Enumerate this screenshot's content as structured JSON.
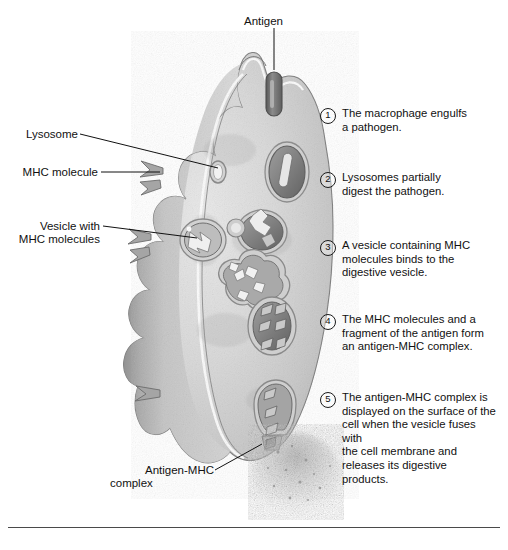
{
  "figure": {
    "type": "biology-diagram",
    "antigen_label": "Antigen",
    "bottom_caption": ""
  },
  "labels": [
    {
      "id": "lysosome",
      "text": "Lysosome"
    },
    {
      "id": "mhc-molecule",
      "text": "MHC molecule"
    },
    {
      "id": "vesicle-mhc",
      "line1": "Vesicle with",
      "line2": "MHC molecules"
    },
    {
      "id": "antigen-mhc",
      "line1": "Antigen-MHC",
      "line2": "complex"
    }
  ],
  "steps": [
    {
      "num": "1",
      "text": "The macrophage engulfs\na pathogen."
    },
    {
      "num": "2",
      "text": "Lysosomes partially\ndigest the pathogen."
    },
    {
      "num": "3",
      "text": "A vesicle containing MHC\nmolecules binds to the\ndigestive vesicle."
    },
    {
      "num": "4",
      "text": "The MHC molecules and a\nfragment of the antigen form\nan antigen-MHC complex."
    },
    {
      "num": "5",
      "text": "The antigen-MHC complex is\ndisplayed on the surface of the\ncell when the vesicle fuses with\nthe cell membrane and\nreleases its digestive products."
    }
  ],
  "colors": {
    "background": "#ffffff",
    "ink": "#111111",
    "cell_light": "#dedede",
    "cell_mid": "#bdbdbd",
    "cell_dark": "#8f8f8f",
    "membrane_highlight": "#fbfbfb",
    "membrane_outline": "#6a6a6a",
    "vesicle_dark": "#707070",
    "antigen_dark": "#6d6d6d",
    "rule": "#4a4a4a"
  }
}
